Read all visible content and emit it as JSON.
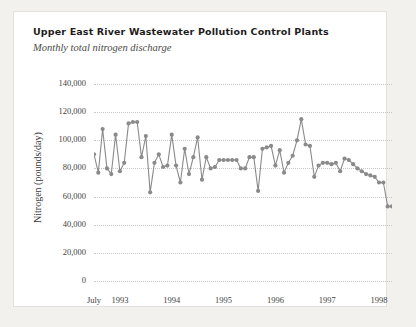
{
  "header": {
    "title": "Upper East River Wastewater Pollution Control Plants",
    "subtitle": "Monthly total nitrogen discharge"
  },
  "axes": {
    "ylabel": "Nitrogen (pounds/day)",
    "yticks": [
      "140,000",
      "120,000",
      "100,000",
      "80,000",
      "60,000",
      "40,000",
      "20,000",
      "0"
    ],
    "ytick_values": [
      140000,
      120000,
      100000,
      80000,
      60000,
      40000,
      20000,
      0
    ],
    "xticks": [
      "July",
      "1993",
      "1994",
      "1995",
      "1996",
      "1997",
      "1998"
    ]
  },
  "style": {
    "series_color": "#8a8a8a",
    "grid_color": "#c9c8c4",
    "text_color": "#43433f",
    "card_background": "#ffffff",
    "page_background": "#f2f1ee"
  },
  "chart_data": {
    "type": "line",
    "title": "Upper East River Wastewater Pollution Control Plants",
    "subtitle": "Monthly total nitrogen discharge",
    "xlabel": "",
    "ylabel": "Nitrogen (pounds/day)",
    "ylim": [
      0,
      140000
    ],
    "xlim": [
      "1992-07",
      "1998-06"
    ],
    "grid": "horizontal-dotted",
    "legend": "none",
    "marker": "circle",
    "x": [
      "1992-07",
      "1992-08",
      "1992-09",
      "1992-10",
      "1992-11",
      "1992-12",
      "1993-01",
      "1993-02",
      "1993-03",
      "1993-04",
      "1993-05",
      "1993-06",
      "1993-07",
      "1993-08",
      "1993-09",
      "1993-10",
      "1993-11",
      "1993-12",
      "1994-01",
      "1994-02",
      "1994-03",
      "1994-04",
      "1994-05",
      "1994-06",
      "1994-07",
      "1994-08",
      "1994-09",
      "1994-10",
      "1994-11",
      "1994-12",
      "1995-01",
      "1995-02",
      "1995-03",
      "1995-04",
      "1995-05",
      "1995-06",
      "1995-07",
      "1995-08",
      "1995-09",
      "1995-10",
      "1995-11",
      "1995-12",
      "1996-01",
      "1996-02",
      "1996-03",
      "1996-04",
      "1996-05",
      "1996-06",
      "1996-07",
      "1996-08",
      "1996-09",
      "1996-10",
      "1996-11",
      "1996-12",
      "1997-01",
      "1997-02",
      "1997-03",
      "1997-04",
      "1997-05",
      "1997-06",
      "1997-07",
      "1997-08",
      "1997-09",
      "1997-10",
      "1997-11",
      "1997-12",
      "1998-01",
      "1998-02",
      "1998-03",
      "1998-04"
    ],
    "values": [
      90000,
      77000,
      108000,
      80000,
      76000,
      104000,
      78000,
      84000,
      112000,
      113000,
      113000,
      88000,
      103000,
      63000,
      84000,
      90000,
      81000,
      82000,
      104000,
      82000,
      70000,
      94000,
      76000,
      88000,
      102000,
      72000,
      88000,
      80000,
      81000,
      86000,
      86000,
      86000,
      86000,
      86000,
      80000,
      80000,
      88000,
      88000,
      64000,
      94000,
      95000,
      96000,
      82000,
      93000,
      77000,
      84000,
      89000,
      100000,
      115000,
      97000,
      96000,
      74000,
      82000,
      84000,
      84000,
      83000,
      84000,
      78000,
      87000,
      86000,
      83000,
      80000,
      78000,
      76000,
      75000,
      74000,
      70000,
      70000,
      53000,
      53000
    ],
    "series": [
      {
        "name": "Total nitrogen discharge",
        "values": [
          90000,
          77000,
          108000,
          80000,
          76000,
          104000,
          78000,
          84000,
          112000,
          113000,
          113000,
          88000,
          103000,
          63000,
          84000,
          90000,
          81000,
          82000,
          104000,
          82000,
          70000,
          94000,
          76000,
          88000,
          102000,
          72000,
          88000,
          80000,
          81000,
          86000,
          86000,
          86000,
          86000,
          86000,
          80000,
          80000,
          88000,
          88000,
          64000,
          94000,
          95000,
          96000,
          82000,
          93000,
          77000,
          84000,
          89000,
          100000,
          115000,
          97000,
          96000,
          74000,
          82000,
          84000,
          84000,
          83000,
          84000,
          78000,
          87000,
          86000,
          83000,
          80000,
          78000,
          76000,
          75000,
          74000,
          70000,
          70000,
          53000,
          53000
        ]
      }
    ]
  }
}
